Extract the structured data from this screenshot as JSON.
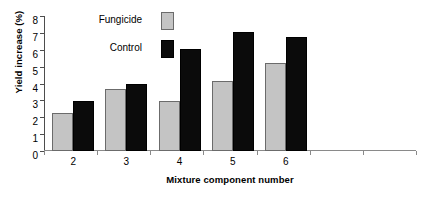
{
  "chart_data": {
    "type": "bar",
    "title": "",
    "xlabel": "Mixture component number",
    "ylabel": "Yield increase (%)",
    "categories": [
      "2",
      "3",
      "4",
      "5",
      "6"
    ],
    "series": [
      {
        "name": "Fungicide",
        "color": "#c4c4c4",
        "values": [
          2.25,
          3.65,
          2.95,
          4.15,
          5.2
        ]
      },
      {
        "name": "Control",
        "color": "#0b0b0b",
        "values": [
          2.95,
          4.0,
          6.05,
          7.05,
          6.75
        ]
      }
    ],
    "ylim": [
      0,
      8
    ],
    "yticks": [
      "0",
      "1",
      "2",
      "3",
      "4",
      "5",
      "6",
      "7",
      "8"
    ],
    "grid": false,
    "legend_position": "upper-left-inside"
  },
  "legend": {
    "items": [
      {
        "label": "Fungicide",
        "swatch": "light-gray-square"
      },
      {
        "label": "Control",
        "swatch": "black-square"
      }
    ]
  }
}
